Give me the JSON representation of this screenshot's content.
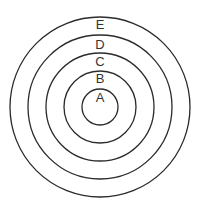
{
  "diagram": {
    "type": "concentric-circles",
    "center": {
      "x": 100,
      "y": 107
    },
    "stroke_color": "#2a2a2a",
    "rings": [
      {
        "label": "A",
        "radius": 18,
        "label_y": 99
      },
      {
        "label": "B",
        "radius": 36,
        "label_y": 80
      },
      {
        "label": "C",
        "radius": 54,
        "label_y": 63
      },
      {
        "label": "D",
        "radius": 72,
        "label_y": 46
      },
      {
        "label": "E",
        "radius": 90,
        "label_y": 26
      }
    ]
  }
}
